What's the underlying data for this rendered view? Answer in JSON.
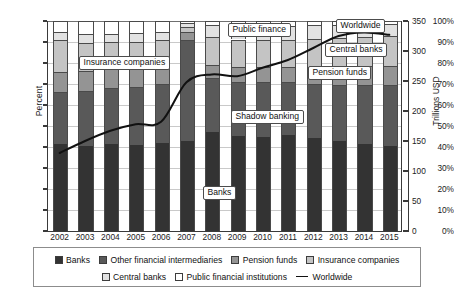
{
  "chart_data": {
    "type": "bar",
    "subtype": "stacked-100-percent-with-line",
    "title": "",
    "xlabel": "",
    "ylabel": "Percent",
    "ylabel_right": "Trillions USD",
    "ylim": [
      0,
      100
    ],
    "ylim_right": [
      0,
      350
    ],
    "grid": true,
    "legend_position": "bottom",
    "categories": [
      "2002",
      "2003",
      "2004",
      "2005",
      "2006",
      "2007",
      "2008",
      "2009",
      "2010",
      "2011",
      "2012",
      "2013",
      "2014",
      "2015"
    ],
    "ytick_labels": [
      "0%",
      "10%",
      "20%",
      "30%",
      "40%",
      "50%",
      "60%",
      "70%",
      "80%",
      "90%",
      "100%"
    ],
    "ytick_values": [
      0,
      10,
      20,
      30,
      40,
      50,
      60,
      70,
      80,
      90,
      100
    ],
    "ytick_labels_right": [
      "0",
      "50",
      "100",
      "150",
      "200",
      "250",
      "300",
      "350"
    ],
    "ytick_values_right": [
      0,
      50,
      100,
      150,
      200,
      250,
      300,
      350
    ],
    "series": [
      {
        "name": "Banks",
        "color": "#333333",
        "values": [
          41.5,
          40.7,
          41.4,
          41.0,
          42.0,
          42.8,
          47.3,
          45.3,
          44.8,
          45.7,
          44.4,
          42.8,
          41.5,
          40.5
        ]
      },
      {
        "name": "Other financial intermediaries",
        "color": "#595959",
        "values": [
          24.8,
          26.0,
          26.7,
          27.8,
          27.9,
          48.0,
          25.7,
          25.8,
          26.3,
          25.1,
          25.7,
          26.6,
          27.8,
          29.2
        ]
      },
      {
        "name": "Pension funds",
        "color": "#949494",
        "values": [
          9.6,
          9.5,
          8.9,
          9.0,
          9.1,
          4.1,
          6.1,
          7.0,
          7.0,
          7.2,
          7.8,
          8.8,
          9.2,
          9.0
        ]
      },
      {
        "name": "Insurance companies",
        "color": "#c4c4c4",
        "values": [
          15.1,
          13.5,
          12.8,
          12.4,
          12.1,
          2.3,
          13.1,
          13.1,
          12.9,
          12.8,
          13.4,
          13.9,
          14.0,
          14.2
        ]
      },
      {
        "name": "Central banks",
        "color": "#e2e2e2",
        "values": [
          3.9,
          4.1,
          4.2,
          4.0,
          3.9,
          1.8,
          5.8,
          6.0,
          6.2,
          6.6,
          6.6,
          6.1,
          6.0,
          5.7
        ]
      },
      {
        "name": "Public financial institutions",
        "color": "#ffffff",
        "values": [
          5.1,
          6.2,
          6.0,
          5.8,
          5.0,
          1.0,
          2.0,
          2.8,
          2.8,
          2.6,
          2.1,
          1.8,
          1.5,
          1.4
        ]
      }
    ],
    "line_series": {
      "name": "Worldwide",
      "color": "#111111",
      "axis": "right",
      "unit": "Trillions USD",
      "values": [
        130,
        150,
        167,
        178,
        182,
        248,
        261,
        258,
        272,
        285,
        305,
        325,
        331,
        327
      ]
    },
    "annotations": [
      {
        "label": "Insurance companies"
      },
      {
        "label": "Public finance"
      },
      {
        "label": "Worldwide"
      },
      {
        "label": "Central banks"
      },
      {
        "label": "Pension funds"
      },
      {
        "label": "Shadow banking"
      },
      {
        "label": "Banks"
      }
    ]
  },
  "axes": {
    "left_title": "Percent",
    "right_title": "Trillions USD"
  },
  "callouts": {
    "insurance_companies": "Insurance companies",
    "public_finance": "Public finance",
    "worldwide": "Worldwide",
    "central_banks": "Central banks",
    "pension_funds": "Pension funds",
    "shadow_banking": "Shadow banking",
    "banks": "Banks"
  },
  "legend": {
    "row1": [
      {
        "label": "Banks",
        "color": "#333333"
      },
      {
        "label": "Other financial intermediaries",
        "color": "#595959"
      },
      {
        "label": "Pension funds",
        "color": "#949494"
      },
      {
        "label": "Insurance companies",
        "color": "#c4c4c4"
      }
    ],
    "row2": [
      {
        "label": "Central banks",
        "color": "#e2e2e2"
      },
      {
        "label": "Public financial institutions",
        "color": "#ffffff"
      },
      {
        "label": "Worldwide",
        "color": "#111111",
        "type": "line"
      }
    ]
  }
}
